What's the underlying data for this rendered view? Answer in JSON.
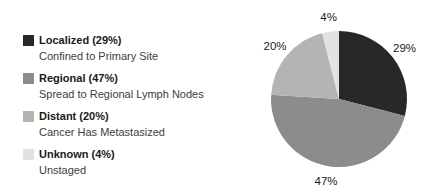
{
  "figure": {
    "background": "#ffffff"
  },
  "legend": {
    "items": [
      {
        "id": "localized",
        "label": "Localized (29%)",
        "sublabel": "Confined to Primary Site",
        "color": "#282828"
      },
      {
        "id": "regional",
        "label": "Regional (47%)",
        "sublabel": "Spread to Regional Lymph Nodes",
        "color": "#8c8c8c"
      },
      {
        "id": "distant",
        "label": "Distant (20%)",
        "sublabel": "Cancer Has Metastasized",
        "color": "#b4b4b4"
      },
      {
        "id": "unknown",
        "label": "Unknown (4%)",
        "sublabel": "Unstaged",
        "color": "#e2e2e2"
      }
    ]
  },
  "chart_data": {
    "type": "pie",
    "title": "",
    "categories": [
      "Localized",
      "Regional",
      "Distant",
      "Unknown"
    ],
    "values": [
      29,
      47,
      20,
      4
    ],
    "slice_labels": [
      "29%",
      "47%",
      "20%",
      "4%"
    ],
    "colors": [
      "#282828",
      "#8c8c8c",
      "#b4b4b4",
      "#e2e2e2"
    ],
    "start_angle_deg": 0,
    "direction": "clockwise",
    "legend_position": "left",
    "legend_entries": [
      "Localized (29%) — Confined to Primary Site",
      "Regional (47%) — Spread to Regional Lymph Nodes",
      "Distant (20%) — Cancer Has Metastasized",
      "Unknown (4%) — Unstaged"
    ]
  }
}
